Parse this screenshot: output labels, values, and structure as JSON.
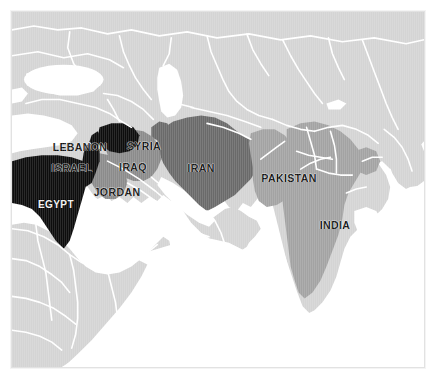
{
  "figure": {
    "kind": "political-map",
    "region": "Middle East and South Asia",
    "background_color": "#ffffff",
    "frame_color": "#e2e2e2"
  },
  "palette": {
    "water": "#ffffff",
    "land_unhighlighted": "#d4d4d4",
    "border_line": "#ffffff",
    "tier_black": "#111111",
    "tier_dark_gray": "#6a6a6a",
    "tier_medium_gray": "#8b8b8b",
    "tier_light_gray": "#a3a3a3",
    "label_dark": "#121212",
    "label_light": "#f2f2f2"
  },
  "labels": [
    {
      "id": "lebanon",
      "text": "LEBANON",
      "x": 68,
      "y": 135,
      "size": 10.5,
      "style": "dark"
    },
    {
      "id": "syria",
      "text": "SYRIA",
      "x": 132,
      "y": 134,
      "size": 10.5,
      "style": "dark"
    },
    {
      "id": "israel",
      "text": "ISRAEL",
      "x": 60,
      "y": 156,
      "size": 10.5,
      "style": "dark"
    },
    {
      "id": "iraq",
      "text": "IRAQ",
      "x": 121,
      "y": 155,
      "size": 10.5,
      "style": "dark"
    },
    {
      "id": "jordan",
      "text": "JORDAN",
      "x": 105,
      "y": 180,
      "size": 10.5,
      "style": "dark"
    },
    {
      "id": "egypt",
      "text": "EGYPT",
      "x": 44,
      "y": 193,
      "size": 10,
      "style": "light"
    },
    {
      "id": "iran",
      "text": "IRAN",
      "x": 189,
      "y": 156,
      "size": 10.5,
      "style": "dark"
    },
    {
      "id": "pakistan",
      "text": "PAKISTAN",
      "x": 277,
      "y": 166,
      "size": 10.5,
      "style": "dark"
    },
    {
      "id": "india",
      "text": "INDIA",
      "x": 323,
      "y": 213,
      "size": 10.5,
      "style": "dark"
    }
  ],
  "countries": [
    {
      "id": "egypt",
      "name": "EGYPT",
      "tier": "tier_black"
    },
    {
      "id": "israel",
      "name": "ISRAEL",
      "tier": "tier_black"
    },
    {
      "id": "lebanon",
      "name": "LEBANON",
      "tier": "tier_black"
    },
    {
      "id": "syria",
      "name": "SYRIA",
      "tier": "tier_black"
    },
    {
      "id": "iraq",
      "name": "IRAQ",
      "tier": "tier_medium_gray"
    },
    {
      "id": "jordan",
      "name": "JORDAN",
      "tier": "tier_medium_gray"
    },
    {
      "id": "iran",
      "name": "IRAN",
      "tier": "tier_dark_gray"
    },
    {
      "id": "pakistan",
      "name": "PAKISTAN",
      "tier": "tier_light_gray"
    },
    {
      "id": "india",
      "name": "INDIA",
      "tier": "tier_light_gray"
    }
  ]
}
